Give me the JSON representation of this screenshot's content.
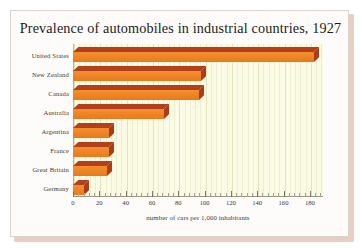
{
  "card": {
    "background_color": "#fdfcfa",
    "border_color": "#d8d3cc",
    "shadow_color": "#e8cfc2"
  },
  "chart_data": {
    "type": "bar",
    "orientation": "horizontal",
    "title": "Prevalence of automobiles in industrial countries, 1927",
    "xlabel": "number of cars per 1,000 inhabitants",
    "ylabel": "",
    "categories": [
      "United States",
      "New Zealand",
      "Canada",
      "Australia",
      "Argentina",
      "France",
      "Great Britain",
      "Germany"
    ],
    "values": [
      183,
      97,
      96,
      69,
      27,
      27,
      26,
      8
    ],
    "xlim": [
      0,
      190
    ],
    "xticks": [
      0,
      20,
      40,
      60,
      80,
      100,
      120,
      140,
      160,
      180
    ],
    "xtick_labels": [
      "0",
      "20",
      "40",
      "60",
      "80",
      "100",
      "120",
      "140",
      "160",
      "180"
    ],
    "grid": true,
    "grid_axis": "x",
    "legend": false,
    "plot_background_color": "#fbfae4",
    "gridline_color": "#efedcf",
    "bar_face_color": "#ef8526",
    "bar_top_color": "#b3401a",
    "bar_side_color": "#a93d18",
    "axis_color": "#9b9682",
    "text_color": "#3c3a36",
    "title_color": "#1d1b19",
    "style": "3d-bars"
  }
}
